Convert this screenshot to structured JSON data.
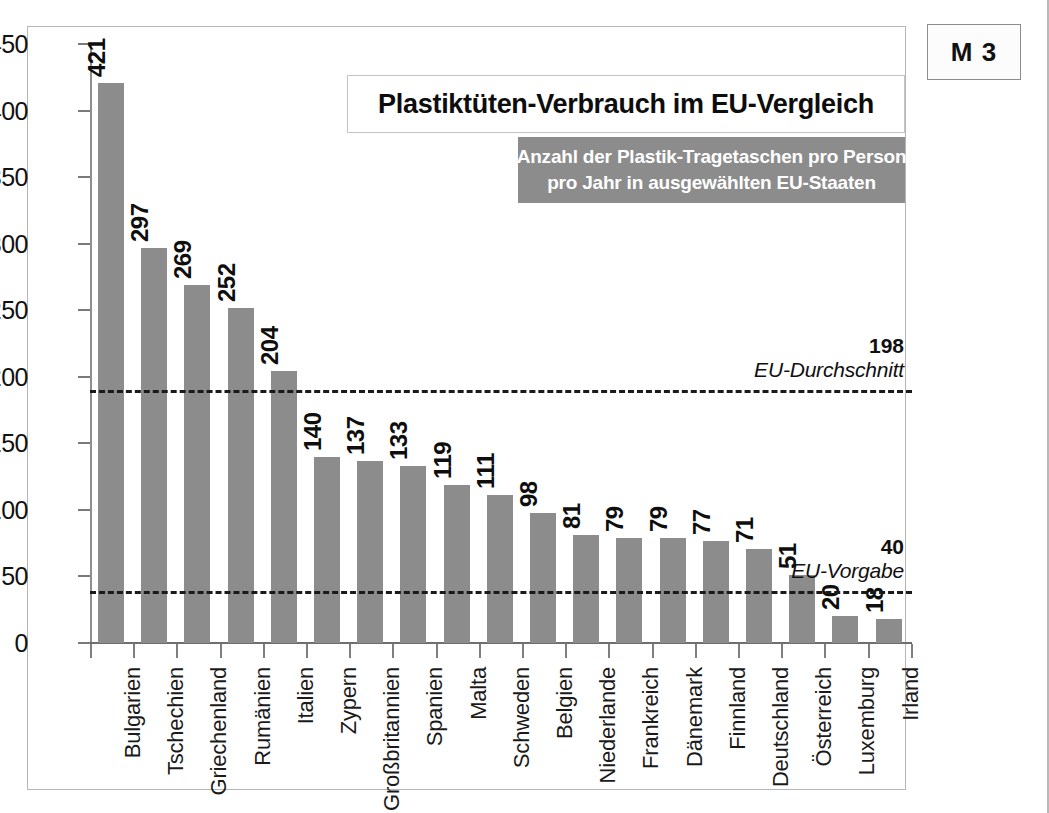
{
  "module_badge": "M 3",
  "title": "Plastiktüten-Verbrauch im EU-Vergleich",
  "subtitle_line1": "Anzahl der Plastik-Tragetaschen pro Person",
  "subtitle_line2": "pro Jahr in ausgewählten EU-Staaten",
  "colors": {
    "bar": "#8c8c8c",
    "subtitle_band": "#8c8c8c",
    "axis": "#7f7f7f",
    "reference_line": "#1a1a1a",
    "text": "#0d0d0d"
  },
  "chart_data": {
    "type": "bar",
    "title": "Plastiktüten-Verbrauch im EU-Vergleich",
    "subtitle": "Anzahl der Plastik-Tragetaschen pro Person pro Jahr in ausgewählten EU-Staaten",
    "xlabel": "",
    "ylabel": "",
    "ylim": [
      0,
      450
    ],
    "yticks": [
      0,
      50,
      100,
      150,
      200,
      250,
      300,
      350,
      400,
      450
    ],
    "grid": false,
    "legend": null,
    "categories": [
      "Bulgarien",
      "Tschechien",
      "Griechenland",
      "Rumänien",
      "Italien",
      "Zypern",
      "Großbritannien",
      "Spanien",
      "Malta",
      "Schweden",
      "Belgien",
      "Niederlande",
      "Frankreich",
      "Dänemark",
      "Finnland",
      "Deutschland",
      "Österreich",
      "Luxemburg",
      "Irland"
    ],
    "values": [
      421,
      297,
      269,
      252,
      204,
      140,
      137,
      133,
      119,
      111,
      98,
      81,
      79,
      79,
      77,
      71,
      51,
      20,
      18
    ],
    "reference_lines": [
      {
        "value": 198,
        "label": "EU-Durchschnitt",
        "plot_value": 190
      },
      {
        "value": 40,
        "label": "EU-Vorgabe",
        "plot_value": 39
      }
    ]
  }
}
